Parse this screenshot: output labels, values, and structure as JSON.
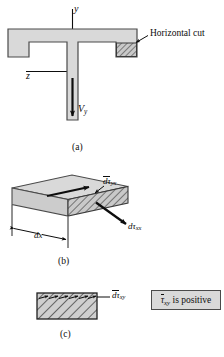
{
  "figure": {
    "caption_a": "(a)",
    "caption_b": "(b)",
    "caption_c": "(c)",
    "colors": {
      "fill_light": "#d9d9d9",
      "fill_mid": "#c6c6c6",
      "fill_dark": "#b0b0b0",
      "stroke": "#4a4a4a",
      "ink": "#0d0d0d",
      "note_fill": "#d9d9d9"
    }
  },
  "panel_a": {
    "axis_y": "y",
    "axis_z": "z",
    "shear_force_label": "V",
    "shear_force_sub": "y",
    "callout": "Horizontal cut"
  },
  "panel_b": {
    "width_label": "dx",
    "shear_stress_label": "dτ",
    "shear_stress_sub": "yx",
    "normal_stress_label": "dτ",
    "normal_stress_sub": "xx"
  },
  "panel_c": {
    "stress_label": "dτ",
    "stress_sub": "xy",
    "note_symbol": "τ",
    "note_sub": "xy",
    "note_text": " is positive"
  }
}
